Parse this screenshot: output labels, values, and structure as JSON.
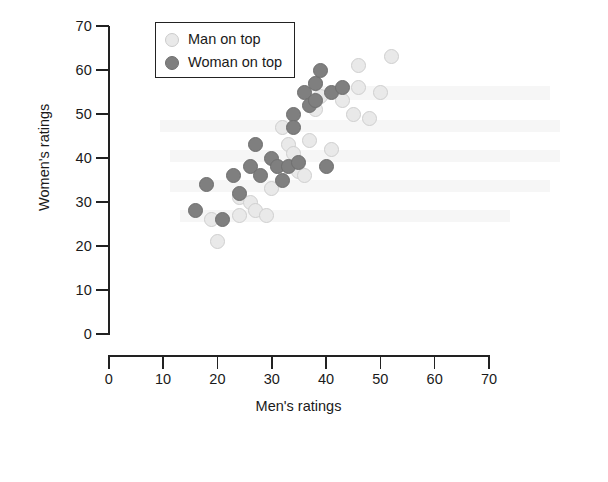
{
  "chart_data": {
    "type": "scatter",
    "title": "",
    "xlabel": "Men's ratings",
    "ylabel": "Women's ratings",
    "xlim": [
      0,
      70
    ],
    "ylim": [
      0,
      70
    ],
    "xticks": [
      0,
      10,
      20,
      30,
      40,
      50,
      60,
      70
    ],
    "yticks": [
      0,
      10,
      20,
      30,
      40,
      50,
      60,
      70
    ],
    "grid": false,
    "legend_position": "upper-left-inside",
    "colors": {
      "man_on_top": "#e9e9e9",
      "woman_on_top": "#7f7f7f",
      "axis": "#222222",
      "background": "#ffffff"
    },
    "series": [
      {
        "name": "Man on top",
        "marker": "circle-light",
        "color": "#e9e9e9",
        "points": [
          [
            20,
            21
          ],
          [
            19,
            26
          ],
          [
            24,
            27
          ],
          [
            24,
            31
          ],
          [
            26,
            30
          ],
          [
            27,
            28
          ],
          [
            29,
            27
          ],
          [
            30,
            33
          ],
          [
            31,
            38
          ],
          [
            32,
            47
          ],
          [
            33,
            43
          ],
          [
            34,
            41
          ],
          [
            35,
            37
          ],
          [
            36,
            36
          ],
          [
            37,
            44
          ],
          [
            38,
            51
          ],
          [
            38,
            57
          ],
          [
            39,
            54
          ],
          [
            41,
            42
          ],
          [
            43,
            53
          ],
          [
            45,
            50
          ],
          [
            46,
            61
          ],
          [
            46,
            56
          ],
          [
            48,
            49
          ],
          [
            50,
            55
          ],
          [
            52,
            63
          ]
        ]
      },
      {
        "name": "Woman on top",
        "marker": "circle-dark",
        "color": "#7f7f7f",
        "points": [
          [
            16,
            28
          ],
          [
            18,
            34
          ],
          [
            21,
            26
          ],
          [
            23,
            36
          ],
          [
            24,
            32
          ],
          [
            26,
            38
          ],
          [
            27,
            43
          ],
          [
            28,
            36
          ],
          [
            30,
            40
          ],
          [
            31,
            38
          ],
          [
            32,
            35
          ],
          [
            33,
            38
          ],
          [
            34,
            50
          ],
          [
            34,
            47
          ],
          [
            35,
            39
          ],
          [
            36,
            55
          ],
          [
            37,
            52
          ],
          [
            38,
            57
          ],
          [
            38,
            53
          ],
          [
            39,
            60
          ],
          [
            40,
            38
          ],
          [
            41,
            55
          ],
          [
            43,
            56
          ]
        ]
      }
    ]
  },
  "legend": {
    "items": [
      {
        "label": "Man on top",
        "style": "man"
      },
      {
        "label": "Woman on top",
        "style": "woman"
      }
    ]
  }
}
